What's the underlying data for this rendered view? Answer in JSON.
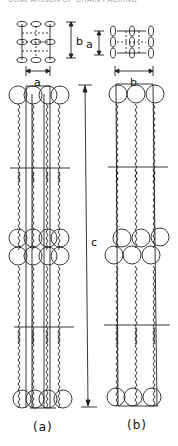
{
  "header": {
    "text": "COMPARISON OF CHAIN PACKING"
  },
  "inset_left": {
    "dimension_vertical": "b",
    "dimension_horizontal": "a"
  },
  "inset_right": {
    "dimension_vertical": "a",
    "dimension_horizontal": "b"
  },
  "main": {
    "dimension_length": "c"
  },
  "captions": {
    "left": "(a)",
    "right": "(b)"
  }
}
